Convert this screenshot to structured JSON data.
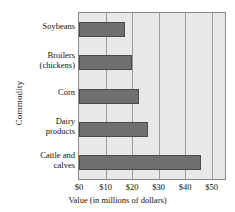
{
  "chart_data": {
    "type": "bar",
    "orientation": "horizontal",
    "title": "",
    "xlabel": "Value (in millions of dollars)",
    "ylabel": "Commodity",
    "categories": [
      "Soybeans",
      "Broilers (chickens)",
      "Corn",
      "Dairy products",
      "Cattle and calves"
    ],
    "values": [
      17.5,
      20,
      22.5,
      26,
      46
    ],
    "xlim": [
      0,
      55
    ],
    "xticks": [
      0,
      10,
      20,
      30,
      40,
      50
    ],
    "xtick_labels": [
      "$0",
      "$10",
      "$20",
      "$30",
      "$40",
      "$50"
    ],
    "grid": "vertical",
    "legend": "none",
    "bar_color": "#6f6f6f",
    "plot_background": "#e8e8e8",
    "gridline_color": "#9a9a9a"
  },
  "axes": {
    "y_title": "Commodity",
    "x_title": "Value (in millions of dollars)"
  },
  "categories": [
    {
      "line1": "Soybeans",
      "line2": ""
    },
    {
      "line1": "Broilers",
      "line2": "(chickens)"
    },
    {
      "line1": "Corn",
      "line2": ""
    },
    {
      "line1": "Dairy",
      "line2": "products"
    },
    {
      "line1": "Cattle and",
      "line2": "calves"
    }
  ],
  "xticks": [
    {
      "label": "$0"
    },
    {
      "label": "$10"
    },
    {
      "label": "$20"
    },
    {
      "label": "$30"
    },
    {
      "label": "$40"
    },
    {
      "label": "$50"
    }
  ]
}
